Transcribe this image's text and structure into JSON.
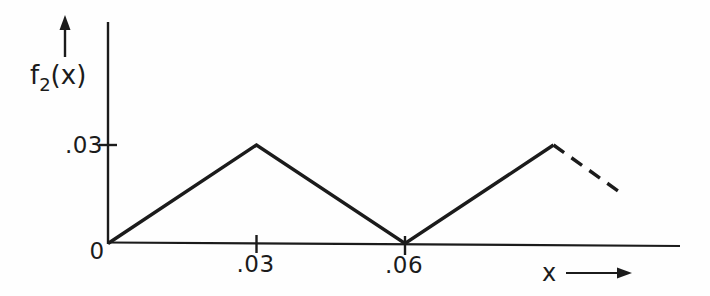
{
  "figure": {
    "background_color": "#fefefe",
    "ink_color": "#1b1b1b"
  },
  "chart_data": {
    "type": "line",
    "title": "",
    "xlabel": "x",
    "ylabel": "f2(x)",
    "ylabel_rich": {
      "base": "f",
      "sub": "2",
      "rest": "(x)"
    },
    "origin_label": "0",
    "x_ticks": [
      {
        "value": 0.03,
        "label": ".03"
      },
      {
        "value": 0.06,
        "label": ".06"
      }
    ],
    "y_ticks": [
      {
        "value": 0.03,
        "label": ".03"
      }
    ],
    "xlim": [
      0,
      0.116
    ],
    "ylim": [
      0,
      0.045
    ],
    "grid": false,
    "legend": "none",
    "series": [
      {
        "name": "f2-waveform",
        "style": "solid",
        "points": [
          [
            0,
            0
          ],
          [
            0.03,
            0.03
          ],
          [
            0.06,
            0
          ],
          [
            0.09,
            0.03
          ]
        ]
      },
      {
        "name": "f2-continuation",
        "style": "dashed",
        "points": [
          [
            0.09,
            0.03
          ],
          [
            0.104,
            0.015
          ]
        ]
      }
    ]
  }
}
